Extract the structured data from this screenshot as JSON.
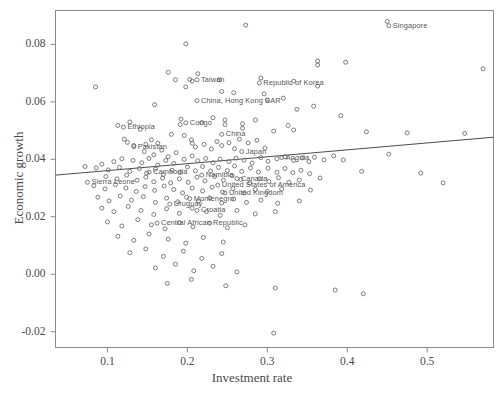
{
  "chart_data": {
    "type": "scatter",
    "title": "",
    "xlabel": "Investment rate",
    "ylabel": "Economic growth",
    "xlim": [
      0.035,
      0.583
    ],
    "ylim": [
      -0.0255,
      0.0918
    ],
    "grid": false,
    "legend": null,
    "xticks": [
      0.1,
      0.2,
      0.3,
      0.4,
      0.5
    ],
    "xtick_labels": [
      "0.1",
      "0.2",
      "0.3",
      "0.4",
      "0.5"
    ],
    "yticks": [
      -0.02,
      0.0,
      0.02,
      0.04,
      0.06,
      0.08
    ],
    "ytick_labels": [
      "-0.02",
      "0.00",
      "0.02",
      "0.04",
      "0.06",
      "0.08"
    ],
    "marker": {
      "shape": "open-circle",
      "radius_px": 2.0,
      "stroke": "#6e6e6e",
      "fill": "none"
    },
    "fit_line": {
      "name": "linear fit",
      "color": "#4d4d4d",
      "x_start": 0.035,
      "y_start": 0.0345,
      "x_end": 0.583,
      "y_end": 0.0477
    },
    "annotations": [
      {
        "label": "Singapore",
        "x": 0.452,
        "y": 0.0865
      },
      {
        "label": "Taiwan",
        "x": 0.212,
        "y": 0.0677
      },
      {
        "label": "Republic of Korea",
        "x": 0.29,
        "y": 0.0666
      },
      {
        "label": "China, Hong Kong SAR",
        "x": 0.212,
        "y": 0.0604
      },
      {
        "label": "Congo",
        "x": 0.198,
        "y": 0.0527
      },
      {
        "label": "China",
        "x": 0.243,
        "y": 0.0487
      },
      {
        "label": "Ethiopia",
        "x": 0.12,
        "y": 0.0512
      },
      {
        "label": "Pakistan",
        "x": 0.133,
        "y": 0.0444
      },
      {
        "label": "Japan",
        "x": 0.268,
        "y": 0.0427
      },
      {
        "label": "Angola",
        "x": 0.318,
        "y": 0.0406
      },
      {
        "label": "Cambodia",
        "x": 0.152,
        "y": 0.0355
      },
      {
        "label": "Namibia",
        "x": 0.218,
        "y": 0.0345
      },
      {
        "label": "Canada",
        "x": 0.262,
        "y": 0.0333
      },
      {
        "label": "Sierra Leone",
        "x": 0.075,
        "y": 0.032
      },
      {
        "label": "United States of America",
        "x": 0.238,
        "y": 0.031
      },
      {
        "label": "United Kingdom",
        "x": 0.247,
        "y": 0.0283
      },
      {
        "label": "Montenegro",
        "x": 0.203,
        "y": 0.0263
      },
      {
        "label": "Uruguay",
        "x": 0.178,
        "y": 0.0244
      },
      {
        "label": "Croatia",
        "x": 0.212,
        "y": 0.0222
      },
      {
        "label": "Central African Republic",
        "x": 0.162,
        "y": 0.0178
      }
    ],
    "points": [
      [
        0.45,
        0.088
      ],
      [
        0.198,
        0.0802
      ],
      [
        0.273,
        0.0867
      ],
      [
        0.363,
        0.0742
      ],
      [
        0.398,
        0.0738
      ],
      [
        0.363,
        0.0728
      ],
      [
        0.57,
        0.0715
      ],
      [
        0.213,
        0.0698
      ],
      [
        0.085,
        0.0652
      ],
      [
        0.198,
        0.0652
      ],
      [
        0.333,
        0.0672
      ],
      [
        0.203,
        0.0678
      ],
      [
        0.292,
        0.0683
      ],
      [
        0.363,
        0.0655
      ],
      [
        0.176,
        0.0703
      ],
      [
        0.185,
        0.0677
      ],
      [
        0.206,
        0.0672
      ],
      [
        0.24,
        0.0677
      ],
      [
        0.159,
        0.059
      ],
      [
        0.32,
        0.0613
      ],
      [
        0.243,
        0.0636
      ],
      [
        0.258,
        0.0632
      ],
      [
        0.296,
        0.0628
      ],
      [
        0.3,
        0.0606
      ],
      [
        0.337,
        0.0574
      ],
      [
        0.358,
        0.0585
      ],
      [
        0.392,
        0.0552
      ],
      [
        0.113,
        0.0518
      ],
      [
        0.128,
        0.053
      ],
      [
        0.141,
        0.0505
      ],
      [
        0.192,
        0.054
      ],
      [
        0.218,
        0.0528
      ],
      [
        0.232,
        0.0545
      ],
      [
        0.247,
        0.0537
      ],
      [
        0.247,
        0.0521
      ],
      [
        0.269,
        0.0524
      ],
      [
        0.269,
        0.0508
      ],
      [
        0.285,
        0.0537
      ],
      [
        0.191,
        0.0521
      ],
      [
        0.308,
        0.0498
      ],
      [
        0.326,
        0.0518
      ],
      [
        0.333,
        0.0502
      ],
      [
        0.424,
        0.0496
      ],
      [
        0.475,
        0.0492
      ],
      [
        0.547,
        0.049
      ],
      [
        0.18,
        0.0487
      ],
      [
        0.196,
        0.0483
      ],
      [
        0.205,
        0.0468
      ],
      [
        0.121,
        0.047
      ],
      [
        0.125,
        0.0459
      ],
      [
        0.133,
        0.0448
      ],
      [
        0.148,
        0.0452
      ],
      [
        0.155,
        0.0468
      ],
      [
        0.163,
        0.0456
      ],
      [
        0.206,
        0.0456
      ],
      [
        0.21,
        0.0443
      ],
      [
        0.221,
        0.0452
      ],
      [
        0.23,
        0.0436
      ],
      [
        0.237,
        0.0462
      ],
      [
        0.243,
        0.0448
      ],
      [
        0.252,
        0.0458
      ],
      [
        0.259,
        0.0437
      ],
      [
        0.265,
        0.047
      ],
      [
        0.276,
        0.0457
      ],
      [
        0.287,
        0.0466
      ],
      [
        0.297,
        0.0439
      ],
      [
        0.146,
        0.0427
      ],
      [
        0.158,
        0.0416
      ],
      [
        0.168,
        0.0432
      ],
      [
        0.176,
        0.0409
      ],
      [
        0.186,
        0.0423
      ],
      [
        0.196,
        0.04
      ],
      [
        0.093,
        0.0383
      ],
      [
        0.108,
        0.0392
      ],
      [
        0.118,
        0.0402
      ],
      [
        0.132,
        0.0396
      ],
      [
        0.143,
        0.0388
      ],
      [
        0.152,
        0.0403
      ],
      [
        0.163,
        0.038
      ],
      [
        0.173,
        0.0396
      ],
      [
        0.183,
        0.0386
      ],
      [
        0.206,
        0.0412
      ],
      [
        0.213,
        0.0395
      ],
      [
        0.223,
        0.0403
      ],
      [
        0.232,
        0.0388
      ],
      [
        0.241,
        0.0401
      ],
      [
        0.252,
        0.0392
      ],
      [
        0.261,
        0.0404
      ],
      [
        0.271,
        0.0397
      ],
      [
        0.281,
        0.0387
      ],
      [
        0.292,
        0.0406
      ],
      [
        0.301,
        0.0393
      ],
      [
        0.312,
        0.0402
      ],
      [
        0.322,
        0.0409
      ],
      [
        0.333,
        0.0396
      ],
      [
        0.344,
        0.0405
      ],
      [
        0.352,
        0.0392
      ],
      [
        0.359,
        0.0407
      ],
      [
        0.371,
        0.0398
      ],
      [
        0.383,
        0.0412
      ],
      [
        0.395,
        0.0398
      ],
      [
        0.072,
        0.0375
      ],
      [
        0.086,
        0.037
      ],
      [
        0.101,
        0.0363
      ],
      [
        0.115,
        0.0372
      ],
      [
        0.128,
        0.0358
      ],
      [
        0.14,
        0.0368
      ],
      [
        0.149,
        0.0352
      ],
      [
        0.16,
        0.0366
      ],
      [
        0.17,
        0.0347
      ],
      [
        0.181,
        0.0362
      ],
      [
        0.191,
        0.0354
      ],
      [
        0.2,
        0.0373
      ],
      [
        0.21,
        0.036
      ],
      [
        0.219,
        0.0375
      ],
      [
        0.229,
        0.0359
      ],
      [
        0.239,
        0.0372
      ],
      [
        0.25,
        0.0361
      ],
      [
        0.259,
        0.0377
      ],
      [
        0.268,
        0.0358
      ],
      [
        0.279,
        0.037
      ],
      [
        0.289,
        0.0356
      ],
      [
        0.301,
        0.0369
      ],
      [
        0.312,
        0.0355
      ],
      [
        0.322,
        0.0368
      ],
      [
        0.332,
        0.0354
      ],
      [
        0.342,
        0.0362
      ],
      [
        0.353,
        0.035
      ],
      [
        0.418,
        0.0358
      ],
      [
        0.098,
        0.034
      ],
      [
        0.112,
        0.0332
      ],
      [
        0.124,
        0.0345
      ],
      [
        0.137,
        0.0327
      ],
      [
        0.148,
        0.0338
      ],
      [
        0.158,
        0.0322
      ],
      [
        0.169,
        0.0335
      ],
      [
        0.179,
        0.0318
      ],
      [
        0.19,
        0.0332
      ],
      [
        0.201,
        0.032
      ],
      [
        0.212,
        0.0338
      ],
      [
        0.222,
        0.0325
      ],
      [
        0.234,
        0.034
      ],
      [
        0.245,
        0.0327
      ],
      [
        0.256,
        0.0343
      ],
      [
        0.267,
        0.033
      ],
      [
        0.278,
        0.0318
      ],
      [
        0.29,
        0.0332
      ],
      [
        0.302,
        0.0323
      ],
      [
        0.314,
        0.0336
      ],
      [
        0.327,
        0.032
      ],
      [
        0.34,
        0.0328
      ],
      [
        0.366,
        0.0335
      ],
      [
        0.083,
        0.0308
      ],
      [
        0.097,
        0.0297
      ],
      [
        0.11,
        0.0312
      ],
      [
        0.123,
        0.03
      ],
      [
        0.136,
        0.0288
      ],
      [
        0.147,
        0.0305
      ],
      [
        0.159,
        0.0292
      ],
      [
        0.171,
        0.0307
      ],
      [
        0.183,
        0.0295
      ],
      [
        0.194,
        0.0283
      ],
      [
        0.206,
        0.03
      ],
      [
        0.219,
        0.029
      ],
      [
        0.231,
        0.0303
      ],
      [
        0.244,
        0.0286
      ],
      [
        0.257,
        0.0298
      ],
      [
        0.271,
        0.0283
      ],
      [
        0.285,
        0.0295
      ],
      [
        0.3,
        0.0288
      ],
      [
        0.318,
        0.0297
      ],
      [
        0.354,
        0.0293
      ],
      [
        0.088,
        0.0268
      ],
      [
        0.102,
        0.0255
      ],
      [
        0.116,
        0.0272
      ],
      [
        0.13,
        0.0258
      ],
      [
        0.145,
        0.027
      ],
      [
        0.16,
        0.025
      ],
      [
        0.174,
        0.0265
      ],
      [
        0.188,
        0.0252
      ],
      [
        0.199,
        0.0268
      ],
      [
        0.214,
        0.0255
      ],
      [
        0.228,
        0.0266
      ],
      [
        0.243,
        0.0248
      ],
      [
        0.258,
        0.0262
      ],
      [
        0.274,
        0.025
      ],
      [
        0.292,
        0.0258
      ],
      [
        0.313,
        0.0247
      ],
      [
        0.34,
        0.0255
      ],
      [
        0.093,
        0.023
      ],
      [
        0.108,
        0.0218
      ],
      [
        0.126,
        0.0236
      ],
      [
        0.142,
        0.0222
      ],
      [
        0.158,
        0.0208
      ],
      [
        0.174,
        0.0228
      ],
      [
        0.19,
        0.0212
      ],
      [
        0.206,
        0.023
      ],
      [
        0.224,
        0.0218
      ],
      [
        0.241,
        0.0205
      ],
      [
        0.262,
        0.0222
      ],
      [
        0.285,
        0.021
      ],
      [
        0.31,
        0.0218
      ],
      [
        0.1,
        0.0182
      ],
      [
        0.118,
        0.0168
      ],
      [
        0.138,
        0.019
      ],
      [
        0.155,
        0.0172
      ],
      [
        0.172,
        0.0158
      ],
      [
        0.19,
        0.018
      ],
      [
        0.207,
        0.0165
      ],
      [
        0.228,
        0.0178
      ],
      [
        0.25,
        0.0162
      ],
      [
        0.272,
        0.0172
      ],
      [
        0.113,
        0.0132
      ],
      [
        0.133,
        0.0118
      ],
      [
        0.152,
        0.014
      ],
      [
        0.176,
        0.0122
      ],
      [
        0.198,
        0.0108
      ],
      [
        0.22,
        0.0128
      ],
      [
        0.245,
        0.0112
      ],
      [
        0.128,
        0.0075
      ],
      [
        0.148,
        0.0088
      ],
      [
        0.17,
        0.0062
      ],
      [
        0.195,
        0.008
      ],
      [
        0.218,
        0.0055
      ],
      [
        0.243,
        0.0072
      ],
      [
        0.16,
        0.0022
      ],
      [
        0.185,
        0.0035
      ],
      [
        0.208,
        0.0012
      ],
      [
        0.232,
        0.0028
      ],
      [
        0.262,
        0.0008
      ],
      [
        0.175,
        -0.0032
      ],
      [
        0.205,
        -0.0018
      ],
      [
        0.248,
        -0.004
      ],
      [
        0.31,
        -0.0048
      ],
      [
        0.385,
        -0.0055
      ],
      [
        0.42,
        -0.0068
      ],
      [
        0.308,
        -0.0205
      ],
      [
        0.452,
        0.0418
      ],
      [
        0.492,
        0.0352
      ],
      [
        0.52,
        0.0318
      ]
    ]
  }
}
